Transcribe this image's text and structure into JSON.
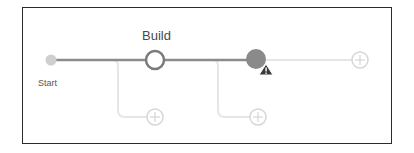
{
  "pipeline": {
    "start_label": "Start",
    "stages": [
      {
        "name": "Build",
        "state": "not-run"
      },
      {
        "name": "",
        "state": "warning"
      }
    ],
    "add_buttons": [
      {
        "id": "add-parallel-build",
        "icon": "plus-circle-icon"
      },
      {
        "id": "add-parallel-stage2",
        "icon": "plus-circle-icon"
      },
      {
        "id": "add-stage-end",
        "icon": "plus-circle-icon"
      }
    ],
    "warning_icon": "warning-triangle-icon"
  },
  "colors": {
    "line": "#8c8c8c",
    "faint_line": "#e2e2e2",
    "start_dot": "#cfcfcf",
    "node_ring": "#7a7a7a",
    "warning_node": "#8a8a8a",
    "warning_badge": "#3a3a3a",
    "plus": "#d6d6d6",
    "frame": "#2b2b2b"
  }
}
